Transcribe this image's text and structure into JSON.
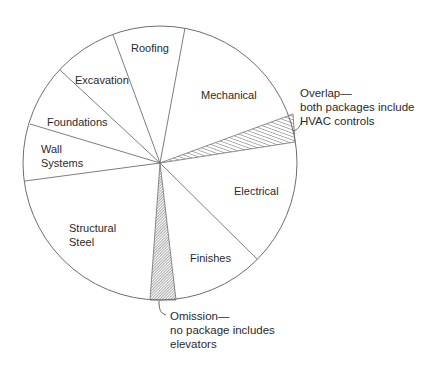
{
  "diagram": {
    "title": "",
    "type": "pie-scope-diagram",
    "segments": [
      {
        "id": "roofing",
        "label_lines": [
          "Roofing"
        ]
      },
      {
        "id": "mechanical",
        "label_lines": [
          "Mechanical"
        ]
      },
      {
        "id": "overlap",
        "label_lines": [],
        "pattern": "hatched"
      },
      {
        "id": "electrical",
        "label_lines": [
          "Electrical"
        ]
      },
      {
        "id": "finishes",
        "label_lines": [
          "Finishes"
        ]
      },
      {
        "id": "omission",
        "label_lines": [],
        "pattern": "hatched"
      },
      {
        "id": "structural-steel",
        "label_lines": [
          "Structural",
          "Steel"
        ]
      },
      {
        "id": "wall-systems",
        "label_lines": [
          "Wall",
          "Systems"
        ]
      },
      {
        "id": "foundations",
        "label_lines": [
          "Foundations"
        ]
      },
      {
        "id": "excavation",
        "label_lines": [
          "Excavation"
        ]
      }
    ],
    "callouts": {
      "overlap": [
        "Overlap—",
        "both packages include",
        "HVAC controls"
      ],
      "omission": [
        "Omission—",
        "no package includes",
        "elevators"
      ]
    },
    "colors": {
      "line": "#6e6e6e",
      "text": "#2a2a2a",
      "background": "#ffffff"
    }
  }
}
